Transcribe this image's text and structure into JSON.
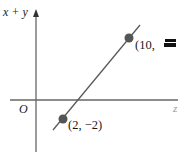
{
  "diagram": {
    "y_axis_label": "x + y",
    "x_axis_label": "z",
    "origin_label": "O",
    "points": [
      {
        "label": "(2, −2)",
        "x": 2,
        "y": -2
      },
      {
        "label": "(10, ",
        "x": 10,
        "y": null,
        "label_obscured": true
      }
    ],
    "colors": {
      "axis": "#555555",
      "line": "#555555",
      "point": "#555555",
      "text": "#1a1a1a"
    }
  }
}
